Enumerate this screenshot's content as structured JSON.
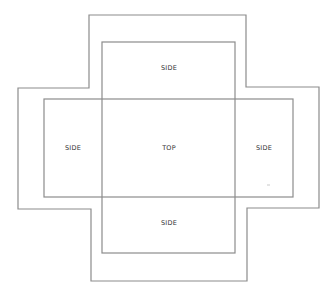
{
  "diagram": {
    "type": "box-net",
    "stroke_color": "#8c8c8c",
    "outer_outline": {
      "points": [
        [
          89,
          15
        ],
        [
          246,
          15
        ],
        [
          246,
          87
        ],
        [
          319,
          87
        ],
        [
          319,
          208
        ],
        [
          247,
          208
        ],
        [
          247,
          281
        ],
        [
          91,
          281
        ],
        [
          91,
          209
        ],
        [
          18,
          209
        ],
        [
          18,
          88
        ],
        [
          89,
          88
        ]
      ]
    },
    "inner_vertical_rect": {
      "x": 102,
      "y": 42,
      "w": 133,
      "h": 211
    },
    "inner_horizontal_rect": {
      "x": 44,
      "y": 99,
      "w": 249,
      "h": 98
    },
    "panels": [
      {
        "id": "top-side",
        "label": "SIDE",
        "x": 169,
        "y": 70
      },
      {
        "id": "center-top",
        "label": "TOP",
        "x": 169,
        "y": 150
      },
      {
        "id": "left-side",
        "label": "SIDE",
        "x": 73,
        "y": 150
      },
      {
        "id": "right-side",
        "label": "SIDE",
        "x": 264,
        "y": 150
      },
      {
        "id": "bottom-side",
        "label": "SIDE",
        "x": 169,
        "y": 225
      }
    ]
  }
}
